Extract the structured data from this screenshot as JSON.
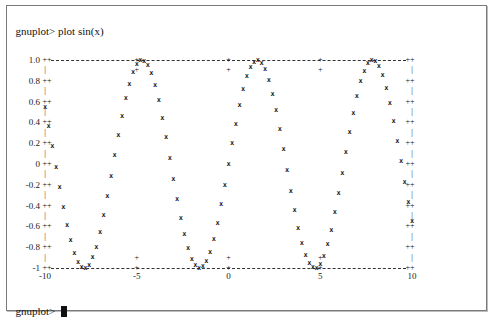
{
  "terminal": {
    "command_line": "gnuplot> plot sin(x)",
    "prompt": "gnuplot> "
  },
  "chart_data": {
    "type": "line",
    "title": "",
    "function": "sin(x)",
    "xlabel": "",
    "ylabel": "",
    "xlim": [
      -10,
      10
    ],
    "ylim": [
      -1,
      1
    ],
    "x_ticks": [
      "-10",
      "-5",
      "0",
      "5",
      "10"
    ],
    "y_ticks": [
      "1.0",
      "0.8",
      "0.6",
      "0.4",
      "0.2",
      "0",
      "-0.2",
      "-0.4",
      "-0.6",
      "-0.8",
      "-1"
    ],
    "grid": false,
    "legend": "none",
    "marker": "x",
    "x": [
      -10,
      -9.5,
      -9,
      -8.5,
      -8,
      -7.5,
      -7,
      -6.5,
      -6,
      -5.5,
      -5,
      -4.5,
      -4,
      -3.5,
      -3,
      -2.5,
      -2,
      -1.5,
      -1,
      -0.5,
      0,
      0.5,
      1,
      1.5,
      2,
      2.5,
      3,
      3.5,
      4,
      4.5,
      5,
      5.5,
      6,
      6.5,
      7,
      7.5,
      8,
      8.5,
      9,
      9.5,
      10
    ],
    "values": [
      0.54,
      0.08,
      -0.41,
      -0.8,
      -0.99,
      -0.94,
      -0.66,
      -0.22,
      0.28,
      0.71,
      0.96,
      0.98,
      0.76,
      0.35,
      -0.14,
      -0.6,
      -0.91,
      -1.0,
      -0.84,
      -0.48,
      0,
      0.48,
      0.84,
      1.0,
      0.91,
      0.6,
      0.14,
      -0.35,
      -0.76,
      -0.98,
      -0.96,
      -0.71,
      -0.28,
      0.22,
      0.66,
      0.94,
      0.99,
      0.8,
      0.41,
      -0.08,
      -0.54
    ]
  },
  "colors": {
    "background": "#ffffff",
    "text": "#111111",
    "border": "#7a7a7a"
  }
}
